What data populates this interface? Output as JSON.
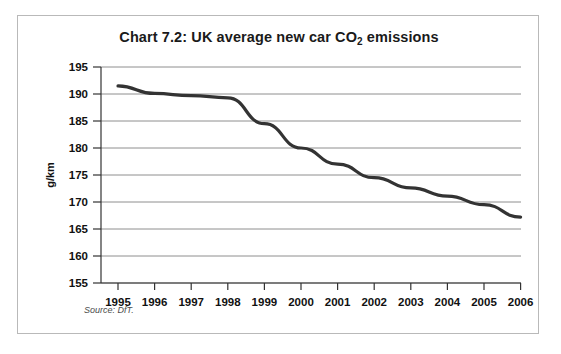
{
  "figure": {
    "title_prefix": "Chart 7.2: UK average new car CO",
    "title_subscript": "2",
    "title_suffix": " emissions",
    "title_full": "Chart 7.2: UK average new car CO2 emissions",
    "source_note": "Source: DfT.",
    "frame_color": "#b9b9b9",
    "background": "#ffffff"
  },
  "chart_data": {
    "type": "line",
    "title": "Chart 7.2: UK average new car CO2 emissions",
    "xlabel": "",
    "ylabel": "g/km",
    "categories": [
      "1995",
      "1996",
      "1997",
      "1998",
      "1999",
      "2000",
      "2001",
      "2002",
      "2003",
      "2004",
      "2005",
      "2006"
    ],
    "x": [
      1995,
      1996,
      1997,
      1998,
      1999,
      2000,
      2001,
      2002,
      2003,
      2004,
      2005,
      2006
    ],
    "values": [
      191.5,
      190.1,
      189.7,
      189.3,
      184.5,
      180.0,
      177.0,
      174.5,
      172.6,
      171.1,
      169.5,
      167.2
    ],
    "series": [
      {
        "name": "UK average new car CO2 emissions",
        "values": [
          191.5,
          190.1,
          189.7,
          189.3,
          184.5,
          180.0,
          177.0,
          174.5,
          172.6,
          171.1,
          169.5,
          167.2
        ],
        "color": "#333333"
      }
    ],
    "ylim": [
      155,
      195
    ],
    "yticks": [
      155,
      160,
      165,
      170,
      175,
      180,
      185,
      190,
      195
    ],
    "ytick_labels": [
      "155",
      "160",
      "165",
      "170",
      "175",
      "180",
      "185",
      "190",
      "195"
    ],
    "xtick_labels": [
      "1995",
      "1996",
      "1997",
      "1998",
      "1999",
      "2000",
      "2001",
      "2002",
      "2003",
      "2004",
      "2005",
      "2006"
    ],
    "grid": "horizontal",
    "legend": "none",
    "line_color": "#333333",
    "gridline_color": "#8e8e8e",
    "units": "g/km"
  }
}
